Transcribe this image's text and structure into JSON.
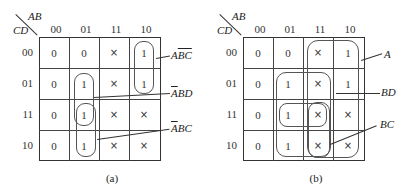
{
  "panels": [
    {
      "id": "a",
      "caption": "(a)",
      "corner": {
        "col_var": "AB",
        "row_var": "CD"
      },
      "col_headers": [
        "00",
        "01",
        "11",
        "10"
      ],
      "row_headers": [
        "00",
        "01",
        "11",
        "10"
      ],
      "cells": [
        [
          "0",
          "0",
          "×",
          "1"
        ],
        [
          "0",
          "1",
          "×",
          "1"
        ],
        [
          "0",
          "1",
          "×",
          "×"
        ],
        [
          "0",
          "1",
          "×",
          "×"
        ]
      ],
      "terms": [
        {
          "label": "AB̄C̄",
          "plain": "A",
          "overlined": "BC"
        },
        {
          "label": "ĀBD",
          "overlined": "A",
          "plain": "BD"
        },
        {
          "label": "ĀBC",
          "overlined": "A",
          "plain": "BC"
        }
      ]
    },
    {
      "id": "b",
      "caption": "(b)",
      "corner": {
        "col_var": "AB",
        "row_var": "CD"
      },
      "col_headers": [
        "00",
        "01",
        "11",
        "10"
      ],
      "row_headers": [
        "00",
        "01",
        "11",
        "10"
      ],
      "cells": [
        [
          "0",
          "0",
          "×",
          "1"
        ],
        [
          "0",
          "1",
          "×",
          "1"
        ],
        [
          "0",
          "1",
          "×",
          "×"
        ],
        [
          "0",
          "1",
          "×",
          "×"
        ]
      ],
      "terms": [
        {
          "label": "A"
        },
        {
          "label": "BD"
        },
        {
          "label": "BC"
        }
      ]
    }
  ]
}
